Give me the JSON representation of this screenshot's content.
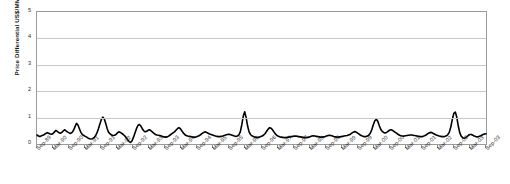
{
  "chart_data": {
    "type": "line",
    "title": "",
    "xlabel": "",
    "ylabel": "Price Differential US$/MMBtu",
    "ylim": [
      0,
      5
    ],
    "yticks": [
      0,
      1,
      2,
      3,
      4,
      5
    ],
    "grid": true,
    "legend": "none",
    "series_color": "#000000",
    "line_width": 1.6,
    "xtick_labels": [
      "Sep-89",
      "Mar-90",
      "Sep-90",
      "Mar-91",
      "Sep-91",
      "Mar-92",
      "Sep-92",
      "Mar-93",
      "Sep-93",
      "Mar-94",
      "Sep-94",
      "Mar-95",
      "Sep-95",
      "Mar-96",
      "Sep-96",
      "Mar-97",
      "Sep-97",
      "Mar-98",
      "Sep-98",
      "Mar-99",
      "Sep-99",
      "Mar-00",
      "Sep-00",
      "Mar-01",
      "Sep-01",
      "Mar-02",
      "Sep-02",
      "Mar-03",
      "Sep-03"
    ],
    "x_start": "Sep-89",
    "x_end": "Sep-03",
    "x_interval_months": 6,
    "series": [
      {
        "name": "Price Differential",
        "values": [
          0.34,
          0.3,
          0.28,
          0.31,
          0.33,
          0.36,
          0.4,
          0.43,
          0.41,
          0.38,
          0.37,
          0.4,
          0.46,
          0.52,
          0.47,
          0.43,
          0.41,
          0.44,
          0.5,
          0.54,
          0.49,
          0.45,
          0.42,
          0.4,
          0.44,
          0.52,
          0.66,
          0.78,
          0.72,
          0.58,
          0.44,
          0.36,
          0.32,
          0.29,
          0.26,
          0.22,
          0.2,
          0.19,
          0.2,
          0.24,
          0.31,
          0.42,
          0.58,
          0.76,
          0.93,
          1.02,
          0.95,
          0.78,
          0.58,
          0.44,
          0.38,
          0.34,
          0.32,
          0.33,
          0.36,
          0.42,
          0.46,
          0.44,
          0.4,
          0.36,
          0.31,
          0.24,
          0.16,
          0.09,
          0.06,
          0.12,
          0.26,
          0.42,
          0.58,
          0.7,
          0.74,
          0.68,
          0.58,
          0.5,
          0.46,
          0.48,
          0.52,
          0.54,
          0.5,
          0.45,
          0.4,
          0.36,
          0.34,
          0.33,
          0.32,
          0.3,
          0.28,
          0.27,
          0.26,
          0.27,
          0.3,
          0.34,
          0.38,
          0.42,
          0.46,
          0.52,
          0.58,
          0.62,
          0.58,
          0.5,
          0.42,
          0.36,
          0.32,
          0.3,
          0.29,
          0.28,
          0.27,
          0.26,
          0.26,
          0.27,
          0.29,
          0.32,
          0.36,
          0.4,
          0.44,
          0.46,
          0.44,
          0.41,
          0.38,
          0.36,
          0.34,
          0.32,
          0.3,
          0.29,
          0.28,
          0.28,
          0.29,
          0.3,
          0.32,
          0.34,
          0.36,
          0.37,
          0.36,
          0.34,
          0.32,
          0.3,
          0.29,
          0.3,
          0.34,
          0.46,
          0.72,
          1.05,
          1.22,
          1.0,
          0.68,
          0.46,
          0.36,
          0.31,
          0.28,
          0.26,
          0.25,
          0.25,
          0.26,
          0.28,
          0.3,
          0.34,
          0.4,
          0.48,
          0.56,
          0.62,
          0.6,
          0.54,
          0.46,
          0.38,
          0.33,
          0.29,
          0.27,
          0.26,
          0.25,
          0.24,
          0.24,
          0.25,
          0.26,
          0.27,
          0.28,
          0.29,
          0.3,
          0.3,
          0.29,
          0.28,
          0.27,
          0.26,
          0.25,
          0.24,
          0.24,
          0.25,
          0.26,
          0.28,
          0.3,
          0.31,
          0.3,
          0.29,
          0.28,
          0.27,
          0.26,
          0.26,
          0.27,
          0.28,
          0.3,
          0.32,
          0.33,
          0.32,
          0.3,
          0.28,
          0.27,
          0.26,
          0.26,
          0.27,
          0.28,
          0.29,
          0.3,
          0.31,
          0.32,
          0.34,
          0.36,
          0.4,
          0.44,
          0.47,
          0.46,
          0.42,
          0.38,
          0.34,
          0.31,
          0.29,
          0.28,
          0.28,
          0.3,
          0.34,
          0.42,
          0.56,
          0.74,
          0.88,
          0.94,
          0.86,
          0.7,
          0.56,
          0.48,
          0.44,
          0.42,
          0.44,
          0.48,
          0.52,
          0.54,
          0.52,
          0.48,
          0.44,
          0.4,
          0.36,
          0.33,
          0.31,
          0.3,
          0.3,
          0.31,
          0.32,
          0.33,
          0.34,
          0.34,
          0.33,
          0.32,
          0.31,
          0.3,
          0.29,
          0.28,
          0.28,
          0.29,
          0.31,
          0.34,
          0.38,
          0.42,
          0.44,
          0.43,
          0.4,
          0.37,
          0.34,
          0.32,
          0.3,
          0.29,
          0.28,
          0.28,
          0.29,
          0.31,
          0.36,
          0.46,
          0.66,
          0.94,
          1.16,
          1.21,
          1.02,
          0.7,
          0.44,
          0.3,
          0.24,
          0.22,
          0.24,
          0.28,
          0.33,
          0.36,
          0.36,
          0.33,
          0.3,
          0.28,
          0.27,
          0.28,
          0.3,
          0.33,
          0.36,
          0.38,
          0.39
        ]
      }
    ],
    "annotations": [
      {
        "label": "peak near Sep-96",
        "value": 1.22
      },
      {
        "label": "peak near Sep-02",
        "value": 1.21
      },
      {
        "label": "peak near Sep-91",
        "value": 1.02
      }
    ]
  }
}
